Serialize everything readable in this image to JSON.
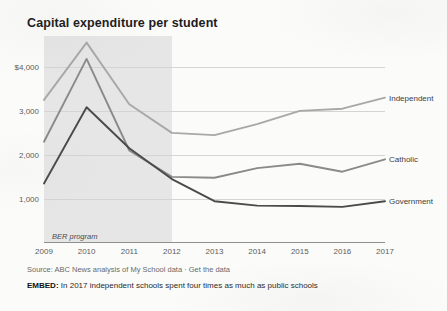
{
  "chart_data": {
    "type": "line",
    "title": "Capital expenditure per student",
    "xlabel": "",
    "ylabel": "",
    "x": [
      2009,
      2010,
      2011,
      2012,
      2013,
      2014,
      2015,
      2016,
      2017
    ],
    "xtick_labels": [
      "2009",
      "2010",
      "2011",
      "2012",
      "2013",
      "2014",
      "2015",
      "2016",
      "2017"
    ],
    "ytick_labels": [
      "$4,000",
      "3,000",
      "2,000",
      "1,000"
    ],
    "ytick_values": [
      4000,
      3000,
      2000,
      1000
    ],
    "ylim": [
      0,
      4700
    ],
    "xlim": [
      2009,
      2017
    ],
    "grid": true,
    "legend_position": "right-inline-labels",
    "series": [
      {
        "name": "Independent",
        "color": "#a8a8a8",
        "values": [
          3250,
          4550,
          3150,
          2500,
          2450,
          2700,
          3000,
          3050,
          3300
        ]
      },
      {
        "name": "Catholic",
        "color": "#8a8a8a",
        "values": [
          2300,
          4180,
          2100,
          1500,
          1480,
          1700,
          1800,
          1620,
          1900
        ]
      },
      {
        "name": "Government",
        "color": "#4a4a4a",
        "values": [
          1350,
          3080,
          2150,
          1450,
          950,
          850,
          840,
          820,
          950
        ]
      }
    ],
    "annotations": [
      {
        "name": "ber-program-band",
        "label": "BER program",
        "x_start": 2009,
        "x_end": 2012,
        "shading_color": "#e2e2e2"
      }
    ]
  },
  "footer": {
    "source_prefix": "Source: ABC News analysis of My School data",
    "source_separator": " · ",
    "source_link": "Get the data",
    "embed_key": "EMBED:",
    "embed_text": " In 2017 independent schools spent four times as much as public schools"
  },
  "colors": {
    "grid": "#d4d4d4",
    "axis": "#8f8f8f",
    "title": "#1c1c1c",
    "tick_text": "#5b5b5b",
    "band": "#e2e2e2"
  }
}
